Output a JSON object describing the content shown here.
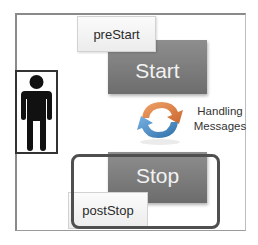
{
  "diagram": {
    "type": "lifecycle",
    "nodes": {
      "pre_start": "preStart",
      "start": "Start",
      "handling": "Handling Messages",
      "stop": "Stop",
      "post_stop": "postStop"
    },
    "handling_lines": [
      "Handling",
      "Messages"
    ],
    "actor": "person-icon",
    "colors": {
      "block_fill": "#7d7d7d",
      "block_text": "#f2f2f2",
      "hook_fill": "#f4f4f4",
      "frame": "#8a8a8a",
      "arrow_orange": "#e8894a",
      "arrow_blue": "#4a8fc9"
    },
    "edges": [
      {
        "from": "preStart",
        "to": "Start"
      },
      {
        "from": "Start",
        "to": "Handling Messages"
      },
      {
        "from": "Handling Messages",
        "to": "Stop"
      },
      {
        "from": "Stop",
        "to": "postStop"
      }
    ]
  }
}
